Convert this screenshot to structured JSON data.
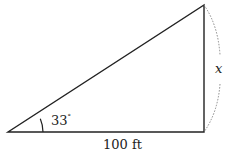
{
  "diagram": {
    "type": "right-triangle",
    "angle_label": "33",
    "degree_symbol": "°",
    "base_label": "100 ft",
    "height_label": "x",
    "colors": {
      "line": "#222222",
      "dotted": "#888888",
      "background": "#ffffff"
    }
  }
}
